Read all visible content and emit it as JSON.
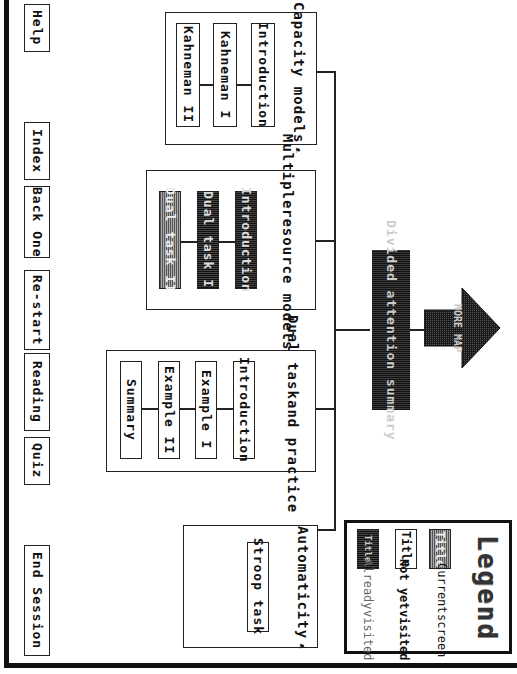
{
  "nav_buttons": {
    "help": "Help",
    "index": "Index",
    "back_one": "Back One",
    "restart": "Re-start",
    "reading": "Reading",
    "quiz": "Quiz",
    "end_session": "End Session"
  },
  "center": {
    "label": "Divided attention summary",
    "more_map": "MORE MAP",
    "state": "visited"
  },
  "groups": [
    {
      "title": "Capacity models",
      "nodes": [
        {
          "label": "Introduction",
          "state": "not_visited"
        },
        {
          "label": "Kahneman I",
          "state": "not_visited"
        },
        {
          "label": "Kahneman II",
          "state": "not_visited"
        }
      ]
    },
    {
      "title_line1": "Multiple",
      "title_line2": "resource models",
      "nodes": [
        {
          "label": "Introduction",
          "state": "visited"
        },
        {
          "label": "Dual task I",
          "state": "visited"
        },
        {
          "label": "Dual task II",
          "state": "current"
        }
      ]
    },
    {
      "title_line1": "Dual task",
      "title_line2": "and practice",
      "nodes": [
        {
          "label": "Introduction",
          "state": "not_visited"
        },
        {
          "label": "Example I",
          "state": "not_visited"
        },
        {
          "label": "Example II",
          "state": "not_visited"
        },
        {
          "label": "Summary",
          "state": "not_visited"
        }
      ]
    },
    {
      "title": "Automaticity",
      "nodes": [
        {
          "label": "Stroop task",
          "state": "not_visited"
        }
      ]
    }
  ],
  "legend": {
    "title": "Legend",
    "items": [
      {
        "swatch": "Title",
        "label_line1": "Current",
        "label_line2": "screen",
        "state": "current"
      },
      {
        "swatch": "Title",
        "label_line1": "Not yet",
        "label_line2": "visited",
        "state": "not_visited"
      },
      {
        "swatch": "Title",
        "label_line1": "Already",
        "label_line2": "visited",
        "state": "visited"
      }
    ]
  },
  "colors": {
    "ink": "#111111",
    "current_fill": "#777777",
    "visited_fill": "#1a1a1a",
    "background": "#ffffff"
  }
}
